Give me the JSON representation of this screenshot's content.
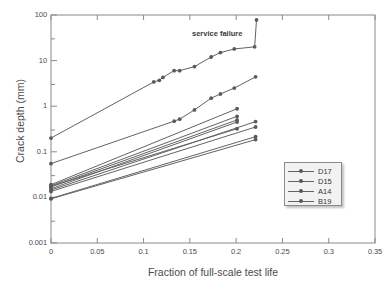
{
  "chart_data": {
    "type": "line",
    "title": "",
    "xlabel": "Fraction of full-scale test life",
    "ylabel": "Crack depth (mm)",
    "xlim": [
      0,
      0.35
    ],
    "ylim": [
      0.001,
      100
    ],
    "yscale": "log",
    "xscale": "linear",
    "grid": false,
    "legend_position": "lower right",
    "xticks": [
      "0",
      "0.05",
      "0.1",
      "0.15",
      "0.2",
      "0.25",
      "0.3",
      "0.35"
    ],
    "xtick_values": [
      0,
      0.05,
      0.1,
      0.15,
      0.2,
      0.25,
      0.3,
      0.35
    ],
    "yticks": [
      "100",
      "10",
      "1",
      "0.1",
      "0.01",
      "0.001"
    ],
    "ytick_values": [
      100,
      10,
      1,
      0.1,
      0.01,
      0.001
    ],
    "annotations": [
      {
        "text": "service failure",
        "x": 0.152,
        "y": 32
      }
    ],
    "legend_entries": [
      "D17",
      "D15",
      "A14",
      "B19"
    ],
    "series": [
      {
        "name": "B19",
        "legend": "B19",
        "x": [
          0.0,
          0.111,
          0.117,
          0.121,
          0.133,
          0.139,
          0.155,
          0.173,
          0.183,
          0.198,
          0.22,
          0.222
        ],
        "y": [
          0.2,
          3.4,
          3.7,
          4.3,
          6.0,
          6.0,
          7.4,
          12.0,
          15.0,
          18.0,
          20.0,
          78.0
        ]
      },
      {
        "name": "D17",
        "legend": "D17",
        "x": [
          0.0,
          0.133,
          0.139,
          0.155,
          0.173,
          0.183,
          0.198,
          0.221
        ],
        "y": [
          0.055,
          0.47,
          0.52,
          0.83,
          1.5,
          1.85,
          2.5,
          4.4
        ]
      },
      {
        "name": "cluster-1",
        "legend": "",
        "x": [
          0.0,
          0.201
        ],
        "y": [
          0.019,
          0.88
        ]
      },
      {
        "name": "cluster-2",
        "legend": "",
        "x": [
          0.0,
          0.201
        ],
        "y": [
          0.018,
          0.6
        ]
      },
      {
        "name": "D15",
        "legend": "D15",
        "x": [
          0.0,
          0.201
        ],
        "y": [
          0.017,
          0.5
        ]
      },
      {
        "name": "cluster-4",
        "legend": "",
        "x": [
          0.0,
          0.201
        ],
        "y": [
          0.0155,
          0.45
        ]
      },
      {
        "name": "cluster-5",
        "legend": "",
        "x": [
          0.0,
          0.221
        ],
        "y": [
          0.0145,
          0.46
        ]
      },
      {
        "name": "A14",
        "legend": "A14",
        "x": [
          0.0,
          0.221
        ],
        "y": [
          0.0135,
          0.35
        ]
      },
      {
        "name": "cluster-7",
        "legend": "",
        "x": [
          0.0,
          0.201
        ],
        "y": [
          0.0175,
          0.32
        ]
      },
      {
        "name": "cluster-8",
        "legend": "",
        "x": [
          0.0,
          0.221
        ],
        "y": [
          0.0095,
          0.215
        ]
      },
      {
        "name": "cluster-9",
        "legend": "",
        "x": [
          0.0,
          0.221
        ],
        "y": [
          0.0093,
          0.185
        ]
      }
    ]
  },
  "axes": {
    "x_title": "Fraction of full-scale test life",
    "y_title": "Crack depth (mm)",
    "x_tick_labels": [
      "0",
      "0.05",
      "0.1",
      "0.15",
      "0.2",
      "0.25",
      "0.3",
      "0.35"
    ],
    "y_tick_labels": [
      "100",
      "10",
      "1",
      "0.1",
      "0.01",
      "0.001"
    ]
  },
  "annotation": {
    "service_failure": "service failure"
  },
  "legend": {
    "items": [
      {
        "label": "D17"
      },
      {
        "label": "D15"
      },
      {
        "label": "A14"
      },
      {
        "label": "B19"
      }
    ]
  },
  "colors": {
    "line": "#636363",
    "marker": "#5a5a5a",
    "axis": "#8a8a8a",
    "text": "#4c4c4c",
    "background": "#ffffff",
    "legend_background": "#f2f2f2"
  }
}
